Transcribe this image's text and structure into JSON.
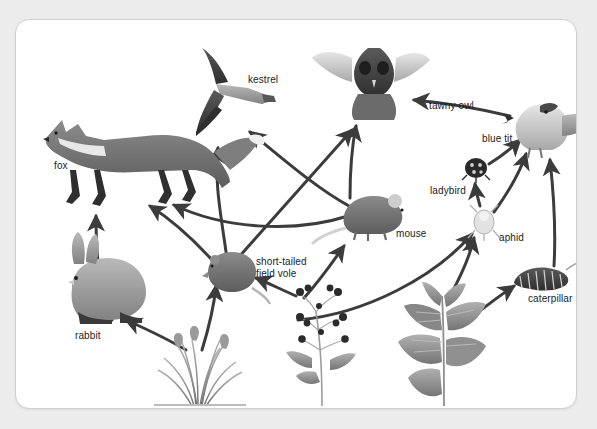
{
  "diagram": {
    "background_color": "#ececec",
    "card_color": "#ffffff",
    "border_color": "#cfcfcf",
    "arrow_color": "#3c3c3c",
    "label_color": "#1c1c1c"
  },
  "organisms": [
    {
      "id": "fox",
      "label": "fox",
      "label_x": 38,
      "label_y": 140,
      "x": 22,
      "y": 92,
      "w": 200,
      "h": 95,
      "kind": "animal"
    },
    {
      "id": "kestrel",
      "label": "kestrel",
      "label_x": 232,
      "label_y": 54,
      "x": 180,
      "y": 28,
      "w": 78,
      "h": 88,
      "kind": "bird"
    },
    {
      "id": "tawny_owl",
      "label": "tawny owl",
      "label_x": 413,
      "label_y": 80,
      "x": 316,
      "y": 25,
      "w": 96,
      "h": 75,
      "kind": "bird"
    },
    {
      "id": "blue_tit",
      "label": "blue tit",
      "label_x": 466,
      "label_y": 113,
      "x": 500,
      "y": 82,
      "w": 82,
      "h": 58,
      "kind": "bird"
    },
    {
      "id": "ladybird",
      "label": "ladybird",
      "label_x": 414,
      "label_y": 165,
      "x": 449,
      "y": 138,
      "w": 22,
      "h": 20,
      "kind": "insect"
    },
    {
      "id": "mouse",
      "label": "mouse",
      "label_x": 380,
      "label_y": 208,
      "x": 325,
      "y": 176,
      "w": 62,
      "h": 42,
      "kind": "animal"
    },
    {
      "id": "aphid",
      "label": "aphid",
      "label_x": 483,
      "label_y": 212,
      "x": 456,
      "y": 186,
      "w": 26,
      "h": 34,
      "kind": "insect"
    },
    {
      "id": "caterpillar",
      "label": "caterpillar",
      "label_x": 512,
      "label_y": 273,
      "x": 497,
      "y": 247,
      "w": 60,
      "h": 26,
      "kind": "insect"
    },
    {
      "id": "field_vole",
      "label": "short-tailed\nfield vole",
      "label_x": 240,
      "label_y": 236,
      "x": 190,
      "y": 234,
      "w": 48,
      "h": 38,
      "kind": "animal"
    },
    {
      "id": "rabbit",
      "label": "rabbit",
      "label_x": 59,
      "label_y": 310,
      "x": 52,
      "y": 232,
      "w": 78,
      "h": 76,
      "kind": "animal"
    },
    {
      "id": "grass",
      "label": "grass",
      "label_x": 162,
      "label_y": 398,
      "x": 135,
      "y": 320,
      "w": 92,
      "h": 66,
      "kind": "plant"
    },
    {
      "id": "blackberry",
      "label": "blackberry",
      "label_x": 302,
      "label_y": 398,
      "x": 272,
      "y": 262,
      "w": 72,
      "h": 124,
      "kind": "plant"
    },
    {
      "id": "nettle",
      "label": "nettle",
      "label_x": 403,
      "label_y": 398,
      "x": 380,
      "y": 268,
      "w": 96,
      "h": 118,
      "kind": "plant"
    }
  ],
  "arrows": [
    {
      "from": "rabbit",
      "to": "fox",
      "path": "M 96 300 C 86 276 80 250 80 196"
    },
    {
      "from": "field_vole",
      "to": "fox",
      "path": "M 196 240 C 176 218 156 200 134 186"
    },
    {
      "from": "mouse",
      "to": "fox",
      "path": "M 332 196 C 276 214 206 208 158 185"
    },
    {
      "from": "field_vole",
      "to": "kestrel",
      "path": "M 212 246 C 206 200 198 166 202 128"
    },
    {
      "from": "mouse",
      "to": "kestrel",
      "path": "M 333 186 C 300 168 266 138 234 112"
    },
    {
      "from": "field_vole",
      "to": "tawny_owl",
      "path": "M 222 238 C 258 198 300 150 336 110"
    },
    {
      "from": "mouse",
      "to": "tawny_owl",
      "path": "M 334 178 C 334 150 336 126 340 106"
    },
    {
      "from": "blue_tit",
      "to": "tawny_owl",
      "path": "M 494 96 C 452 86 420 82 398 80"
    },
    {
      "from": "grass",
      "to": "rabbit",
      "path": "M 170 330 C 150 318 128 308 110 300"
    },
    {
      "from": "grass",
      "to": "field_vole",
      "path": "M 186 330 C 194 304 198 286 200 266"
    },
    {
      "from": "blackberry",
      "to": "field_vole",
      "path": "M 280 276 C 262 268 250 262 240 258"
    },
    {
      "from": "blackberry",
      "to": "mouse",
      "path": "M 288 278 C 306 258 318 240 328 226"
    },
    {
      "from": "blackberry",
      "to": "aphid",
      "path": "M 282 300 C 350 294 420 256 456 214"
    },
    {
      "from": "nettle",
      "to": "aphid",
      "path": "M 434 276 C 446 254 454 236 458 218"
    },
    {
      "from": "nettle",
      "to": "caterpillar",
      "path": "M 452 300 C 470 286 486 274 498 266"
    },
    {
      "from": "aphid",
      "to": "ladybird",
      "path": "M 464 186 C 462 178 460 172 459 164"
    },
    {
      "from": "aphid",
      "to": "blue_tit",
      "path": "M 478 192 C 494 170 504 152 510 134"
    },
    {
      "from": "ladybird",
      "to": "blue_tit",
      "path": "M 473 144 C 486 136 496 128 504 120"
    },
    {
      "from": "caterpillar",
      "to": "blue_tit",
      "path": "M 538 246 C 540 210 538 176 534 140"
    }
  ]
}
